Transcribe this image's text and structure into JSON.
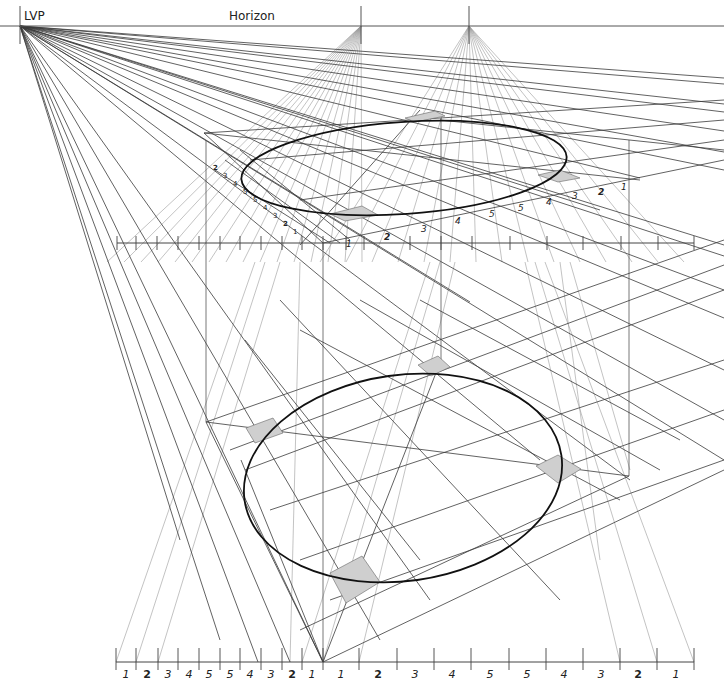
{
  "labels": {
    "lvp": "LVP",
    "horizon": "Horizon"
  },
  "colors": {
    "line_dark": "#3a3a3a",
    "line_light": "#9a9a9a",
    "ellipse": "#111111",
    "shade": "#cfcfcf",
    "text": "#222222"
  },
  "horizon": {
    "y": 26,
    "x1": 0,
    "x2": 724
  },
  "vanishing_points": [
    {
      "name": "LVP",
      "x": 20,
      "y": 26
    },
    {
      "name": "VP2",
      "x": 361,
      "y": 26
    },
    {
      "name": "VP3",
      "x": 469,
      "y": 26
    }
  ],
  "upper_ruler": {
    "y": 243,
    "x1": 117,
    "x2": 694,
    "ticks": [
      117,
      136,
      157,
      178,
      199,
      220,
      240,
      261,
      282,
      302,
      323,
      346,
      364,
      410,
      441,
      472,
      510,
      547,
      583,
      621,
      658,
      694
    ]
  },
  "upper_numbers_diag": [
    "2",
    "3",
    "4",
    "5",
    "5",
    "4",
    "3",
    "2",
    "1"
  ],
  "upper_numbers_right": [
    {
      "t": "1",
      "x": 346,
      "y": 247,
      "bold": false
    },
    {
      "t": "2",
      "x": 384,
      "y": 240,
      "bold": true
    },
    {
      "t": "3",
      "x": 421,
      "y": 232,
      "bold": false
    },
    {
      "t": "4",
      "x": 455,
      "y": 224,
      "bold": false
    },
    {
      "t": "5",
      "x": 489,
      "y": 217,
      "bold": false
    },
    {
      "t": "5",
      "x": 518,
      "y": 211,
      "bold": false
    },
    {
      "t": "4",
      "x": 546,
      "y": 205,
      "bold": false
    },
    {
      "t": "3",
      "x": 572,
      "y": 199,
      "bold": false
    },
    {
      "t": "2",
      "x": 598,
      "y": 195,
      "bold": true
    },
    {
      "t": "1",
      "x": 621,
      "y": 190,
      "bold": false
    }
  ],
  "bottom_ruler": {
    "y": 662,
    "x1": 116,
    "x2": 694,
    "ticks": [
      116,
      136,
      158,
      178,
      199,
      220,
      240,
      261,
      282,
      302,
      323,
      359,
      397,
      434,
      471,
      509,
      546,
      583,
      620,
      657,
      694
    ],
    "numbers": [
      {
        "t": "1",
        "x": 126,
        "bold": false
      },
      {
        "t": "2",
        "x": 147,
        "bold": true
      },
      {
        "t": "3",
        "x": 168,
        "bold": false
      },
      {
        "t": "4",
        "x": 189,
        "bold": false
      },
      {
        "t": "5",
        "x": 209,
        "bold": false
      },
      {
        "t": "5",
        "x": 230,
        "bold": false
      },
      {
        "t": "4",
        "x": 250,
        "bold": false
      },
      {
        "t": "3",
        "x": 271,
        "bold": false
      },
      {
        "t": "2",
        "x": 292,
        "bold": true
      },
      {
        "t": "1",
        "x": 312,
        "bold": false
      },
      {
        "t": "1",
        "x": 341,
        "bold": false
      },
      {
        "t": "2",
        "x": 378,
        "bold": true
      },
      {
        "t": "3",
        "x": 415,
        "bold": false
      },
      {
        "t": "4",
        "x": 452,
        "bold": false
      },
      {
        "t": "5",
        "x": 490,
        "bold": false
      },
      {
        "t": "5",
        "x": 527,
        "bold": false
      },
      {
        "t": "4",
        "x": 564,
        "bold": false
      },
      {
        "t": "3",
        "x": 601,
        "bold": false
      },
      {
        "t": "2",
        "x": 638,
        "bold": true
      },
      {
        "t": "1",
        "x": 676,
        "bold": false
      }
    ]
  },
  "upper_ellipse": {
    "cx": 404,
    "cy": 168,
    "rx": 163,
    "ry": 46,
    "rot": -4
  },
  "lower_ellipse": {
    "cx": 403,
    "cy": 478,
    "rx": 160,
    "ry": 103,
    "rot": -8
  },
  "upper_shades": [
    "M 330 214 L 362 206 L 378 215 L 345 221 Z",
    "M 538 175 L 560 170 L 580 178 L 558 182 Z",
    "M 405 118 L 435 111 L 445 116 L 415 122 Z"
  ],
  "lower_shades": [
    "M 246 428 L 273 418 L 283 433 L 255 443 Z",
    "M 418 365 L 438 356 L 450 367 L 431 376 Z",
    "M 536 466 L 558 455 L 581 469 L 558 483 Z",
    "M 330 573 L 362 556 L 380 582 L 346 603 Z"
  ]
}
